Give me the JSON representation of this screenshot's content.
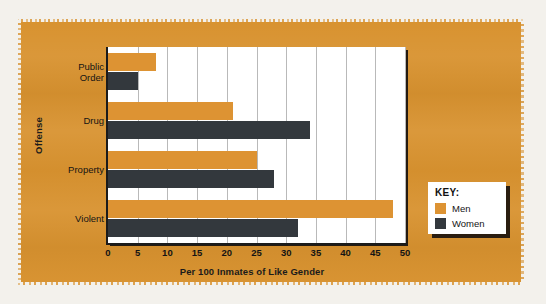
{
  "figure": {
    "panel_color": "#d8922f",
    "page_color": "#f3f1ec"
  },
  "axes": {
    "y_title": "Offense",
    "x_title": "Per 100 Inmates of Like Gender"
  },
  "legend": {
    "title": "KEY:",
    "entries": [
      {
        "label": "Men",
        "color": "#dd9333"
      },
      {
        "label": "Women",
        "color": "#33383d"
      }
    ]
  },
  "chart_data": {
    "type": "bar",
    "orientation": "horizontal",
    "title": "",
    "xlabel": "Per 100 Inmates of Like Gender",
    "ylabel": "Offense",
    "categories": [
      "Public Order",
      "Drug",
      "Property",
      "Violent"
    ],
    "series": [
      {
        "name": "Men",
        "color": "#dd9333",
        "values": [
          8,
          21,
          25,
          48
        ]
      },
      {
        "name": "Women",
        "color": "#33383d",
        "values": [
          5,
          34,
          28,
          32
        ]
      }
    ],
    "xlim": [
      0,
      50
    ],
    "xticks": [
      0,
      5,
      10,
      15,
      20,
      25,
      30,
      35,
      40,
      45,
      50
    ],
    "xtick_labels": [
      "0",
      "5",
      "10",
      "15",
      "20",
      "25",
      "30",
      "35",
      "40",
      "45",
      "50"
    ],
    "grid": "vertical",
    "legend_position": "bottom-right"
  }
}
